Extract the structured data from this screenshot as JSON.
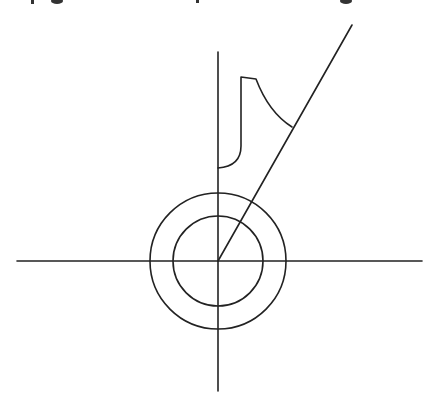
{
  "diagram": {
    "stroke_color": "#222222",
    "stroke_width": 1.6,
    "caption_cropped": true,
    "axes": {
      "horizontal": {
        "x1": 17,
        "y1": 261,
        "x2": 422,
        "y2": 261
      },
      "vertical": {
        "x1": 218,
        "y1": 52,
        "x2": 218,
        "y2": 391
      }
    },
    "circles": [
      {
        "name": "outer-circle",
        "cx": 218,
        "cy": 261,
        "r": 68
      },
      {
        "name": "inner-circle",
        "cx": 218,
        "cy": 261,
        "r": 45
      }
    ],
    "radial_line": {
      "x1": 218,
      "y1": 261,
      "x2": 352,
      "y2": 25
    },
    "outline_shape_path": "M218,168 C232,167 241,160 241,146 L241,77 L256,79 C264,100 276,117 292,127"
  }
}
